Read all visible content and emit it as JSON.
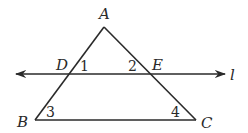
{
  "diagram": {
    "type": "geometry-triangle-with-transversal",
    "vertices": {
      "A": {
        "label": "A",
        "x": 104,
        "y": 27
      },
      "B": {
        "label": "B",
        "x": 35,
        "y": 120
      },
      "C": {
        "label": "C",
        "x": 196,
        "y": 120
      },
      "D": {
        "label": "D",
        "x": 68,
        "y": 74
      },
      "E": {
        "label": "E",
        "x": 152,
        "y": 74
      }
    },
    "line": {
      "label": "l",
      "x1": 16,
      "x2": 225,
      "y": 74
    },
    "angles": [
      {
        "label": "1",
        "at": "D"
      },
      {
        "label": "2",
        "at": "E"
      },
      {
        "label": "3",
        "at": "B"
      },
      {
        "label": "4",
        "at": "C"
      }
    ],
    "stroke_color": "#2a2a2a"
  }
}
